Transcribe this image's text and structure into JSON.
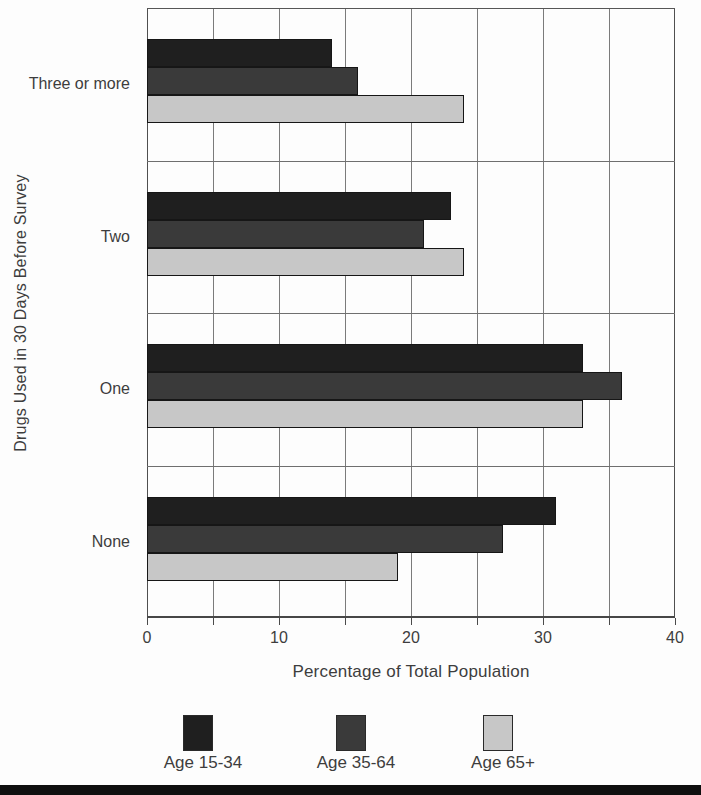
{
  "chart_data": {
    "type": "bar",
    "orientation": "horizontal",
    "title": "",
    "xlabel": "Percentage of Total Population",
    "ylabel": "Drugs Used in 30 Days Before Survey",
    "xlim": [
      0,
      40
    ],
    "xtick_step": 5,
    "xtick_labels": [
      "0",
      "10",
      "20",
      "30",
      "40"
    ],
    "xtick_label_values": [
      0,
      10,
      20,
      30,
      40
    ],
    "grid": "both",
    "categories": [
      "Three or more",
      "Two",
      "One",
      "None"
    ],
    "series": [
      {
        "name": "Age 15-34",
        "color": "#1f1f1f",
        "values": [
          14,
          23,
          33,
          31
        ]
      },
      {
        "name": "Age 35-64",
        "color": "#3a3a3a",
        "values": [
          16,
          21,
          36,
          27
        ]
      },
      {
        "name": "Age 65+",
        "color": "#c7c7c7",
        "values": [
          24,
          24,
          33,
          19
        ]
      }
    ],
    "legend": {
      "position": "bottom",
      "entries": [
        "Age 15-34",
        "Age 35-64",
        "Age 65+"
      ]
    }
  },
  "colors": {
    "grid_line": "#7b7b7b",
    "axis_line": "#474747",
    "text": "#3d3d3d",
    "bar_border": "#161616",
    "page_rule": "#0f0f0f"
  }
}
